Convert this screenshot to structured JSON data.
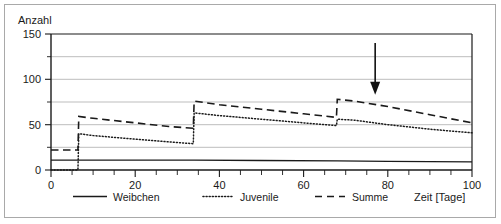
{
  "chart_data": {
    "type": "line",
    "title": "",
    "xlabel": "Zeit [Tage]",
    "ylabel": "Anzahl",
    "xlim": [
      0,
      100
    ],
    "ylim": [
      0,
      150
    ],
    "xticks": [
      0,
      20,
      40,
      60,
      80,
      100
    ],
    "xtick_labels": [
      "0",
      "20",
      "40",
      "60",
      "80",
      "100"
    ],
    "xticks_minor_step": 5,
    "yticks": [
      0,
      50,
      100,
      150
    ],
    "ytick_labels": [
      "0",
      "50",
      "100",
      "150"
    ],
    "yticks_minor": [
      25,
      75,
      125
    ],
    "grid": "horizontal",
    "gridlines": [
      25,
      50,
      75,
      100,
      125,
      150
    ],
    "legend_position": "below-axes",
    "series": [
      {
        "name": "Weibchen",
        "style": "solid",
        "points": [
          [
            0,
            11
          ],
          [
            6.5,
            11
          ],
          [
            20,
            11
          ],
          [
            34,
            11
          ],
          [
            50,
            10.5
          ],
          [
            68,
            10
          ],
          [
            80,
            9.5
          ],
          [
            100,
            9
          ]
        ]
      },
      {
        "name": "Juvenile",
        "style": "dotted",
        "points": [
          [
            0,
            0
          ],
          [
            6.4,
            0
          ],
          [
            6.6,
            40
          ],
          [
            10,
            38
          ],
          [
            20,
            34
          ],
          [
            28,
            31
          ],
          [
            33.8,
            29
          ],
          [
            34.0,
            63
          ],
          [
            40,
            60
          ],
          [
            50,
            56
          ],
          [
            60,
            52
          ],
          [
            67.8,
            49
          ],
          [
            68.0,
            56
          ],
          [
            72,
            55
          ],
          [
            80,
            50
          ],
          [
            90,
            45
          ],
          [
            100,
            41
          ]
        ]
      },
      {
        "name": "Summe",
        "style": "dashed",
        "points": [
          [
            0,
            22
          ],
          [
            6.4,
            22
          ],
          [
            6.6,
            59
          ],
          [
            10,
            57
          ],
          [
            20,
            52
          ],
          [
            28,
            48
          ],
          [
            33.8,
            46
          ],
          [
            34.0,
            76
          ],
          [
            40,
            72
          ],
          [
            50,
            67
          ],
          [
            60,
            62
          ],
          [
            67.8,
            58
          ],
          [
            68.0,
            78
          ],
          [
            72,
            76
          ],
          [
            80,
            70
          ],
          [
            90,
            61
          ],
          [
            100,
            52
          ]
        ]
      }
    ],
    "annotations": [
      {
        "type": "arrow",
        "name": "down-arrow-annotation",
        "x": 77,
        "y_start": 140,
        "y_end": 83,
        "direction": "down"
      }
    ]
  },
  "axes": {
    "y_axis_title": "Anzahl",
    "x_axis_title": "Zeit [Tage]",
    "y_tick_labels": [
      "150",
      "100",
      "50",
      "0"
    ],
    "x_tick_labels": [
      "0",
      "20",
      "40",
      "60",
      "80",
      "100"
    ]
  },
  "legend": {
    "items": [
      {
        "label": "Weibchen",
        "style": "solid"
      },
      {
        "label": "Juvenile",
        "style": "dotted"
      },
      {
        "label": "Summe",
        "style": "dashed"
      }
    ]
  },
  "colors": {
    "ink": "#1a1a1a",
    "gridline": "#b5b5b5",
    "frame": "#a9a9a9",
    "background": "#ffffff"
  }
}
